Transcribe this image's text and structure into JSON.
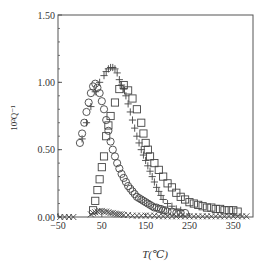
{
  "chart_data": {
    "type": "scatter",
    "title": "",
    "xlabel": "T(℃)",
    "ylabel": "10²Q⁻¹",
    "xlim": [
      -50,
      395
    ],
    "ylim": [
      0,
      1.5
    ],
    "xticks": [
      -50,
      50,
      150,
      250,
      350
    ],
    "yticks": [
      0.0,
      0.5,
      1.0,
      1.5
    ],
    "ytick_labels": [
      "0.00",
      "0.50",
      "1.00",
      "1.50"
    ],
    "grid": false,
    "legend": "none",
    "series": [
      {
        "name": "circle",
        "marker": "circle",
        "x": [
          0,
          5,
          10,
          15,
          20,
          25,
          30,
          35,
          40,
          45,
          50,
          55,
          60,
          65,
          70,
          75,
          80,
          85,
          90,
          95,
          100,
          105,
          110,
          115,
          120,
          125,
          130,
          135,
          140,
          145,
          150,
          155,
          160,
          165,
          170,
          175,
          180,
          185,
          190,
          195,
          200,
          210,
          220,
          230,
          240
        ],
        "y": [
          0.55,
          0.62,
          0.7,
          0.78,
          0.85,
          0.92,
          0.97,
          0.99,
          0.96,
          0.92,
          0.86,
          0.8,
          0.72,
          0.64,
          0.56,
          0.5,
          0.45,
          0.4,
          0.36,
          0.32,
          0.29,
          0.26,
          0.23,
          0.21,
          0.19,
          0.17,
          0.15,
          0.14,
          0.13,
          0.12,
          0.11,
          0.1,
          0.09,
          0.08,
          0.07,
          0.07,
          0.06,
          0.06,
          0.05,
          0.05,
          0.04,
          0.04,
          0.03,
          0.03,
          0.03
        ]
      },
      {
        "name": "plus",
        "marker": "plus",
        "x": [
          5,
          15,
          25,
          35,
          45,
          55,
          60,
          65,
          70,
          75,
          80,
          85,
          90,
          95,
          100,
          105,
          110,
          115,
          120,
          125,
          130,
          135,
          140,
          145,
          150,
          155,
          160,
          165,
          170,
          175,
          180,
          185,
          190,
          200,
          210,
          220,
          230
        ],
        "y": [
          0.58,
          0.7,
          0.82,
          0.93,
          1.0,
          1.05,
          1.08,
          1.1,
          1.11,
          1.11,
          1.1,
          1.07,
          1.02,
          0.98,
          0.95,
          0.9,
          0.84,
          0.78,
          0.72,
          0.66,
          0.6,
          0.55,
          0.5,
          0.46,
          0.42,
          0.38,
          0.34,
          0.3,
          0.26,
          0.22,
          0.19,
          0.16,
          0.13,
          0.1,
          0.08,
          0.06,
          0.05
        ]
      },
      {
        "name": "square",
        "marker": "square",
        "x": [
          30,
          35,
          40,
          45,
          50,
          55,
          60,
          65,
          70,
          80,
          90,
          100,
          110,
          120,
          130,
          140,
          145,
          150,
          155,
          160,
          170,
          180,
          190,
          200,
          210,
          220,
          230,
          240,
          250,
          260,
          270,
          280,
          290,
          300,
          310,
          320,
          330,
          340,
          350,
          360
        ],
        "y": [
          0.05,
          0.12,
          0.2,
          0.28,
          0.37,
          0.45,
          0.6,
          0.68,
          0.75,
          0.85,
          0.95,
          0.98,
          0.94,
          0.88,
          0.8,
          0.7,
          0.62,
          0.55,
          0.5,
          0.45,
          0.4,
          0.35,
          0.3,
          0.25,
          0.22,
          0.18,
          0.15,
          0.13,
          0.11,
          0.1,
          0.09,
          0.08,
          0.07,
          0.07,
          0.06,
          0.06,
          0.05,
          0.05,
          0.05,
          0.04
        ]
      },
      {
        "name": "cross",
        "marker": "x",
        "x": [
          -45,
          -35,
          -25,
          -15,
          25,
          30,
          35,
          40,
          45,
          50,
          55,
          60,
          65,
          70,
          75,
          80,
          85,
          90,
          95,
          100,
          110,
          120,
          130,
          140,
          150,
          160,
          170,
          180,
          190,
          200,
          210,
          220,
          230,
          240,
          250,
          260,
          270,
          280,
          290,
          300,
          310,
          320,
          330,
          340,
          350,
          360,
          370,
          380
        ],
        "y": [
          0.0,
          0.0,
          0.0,
          0.0,
          0.02,
          0.03,
          0.035,
          0.04,
          0.045,
          0.045,
          0.04,
          0.04,
          0.035,
          0.03,
          0.03,
          0.025,
          0.02,
          0.02,
          0.02,
          0.015,
          0.015,
          0.01,
          0.01,
          0.01,
          0.01,
          0.01,
          0.01,
          0.005,
          0.005,
          0.005,
          0.005,
          0.005,
          0.005,
          0.005,
          0.005,
          0.005,
          0.005,
          0.005,
          0.005,
          0.005,
          0.005,
          0.005,
          0.005,
          0.005,
          0.005,
          0.005,
          0.005,
          0.005
        ]
      }
    ]
  }
}
